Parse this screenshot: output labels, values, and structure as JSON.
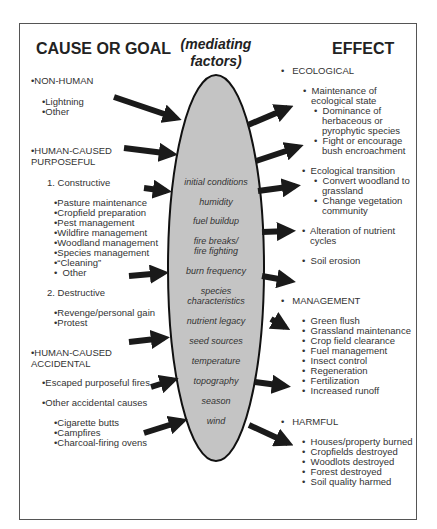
{
  "headers": {
    "cause": "CAUSE OR GOAL",
    "mediating_line1": "(mediating",
    "mediating_line2": "factors)",
    "effect": "EFFECT"
  },
  "causes": {
    "non_human": "•NON-HUMAN",
    "non_human_items": [
      "•Lightning",
      "•Other"
    ],
    "purposeful_line1": "•HUMAN-CAUSED",
    "purposeful_line2": "PURPOSEFUL",
    "constructive": "1. Constructive",
    "constructive_items": [
      "•Pasture maintenance",
      "•Cropfield preparation",
      "•Pest management",
      "•Wildfire management",
      "•Woodland management",
      "•Species management",
      "•“Cleaning”",
      "•  Other"
    ],
    "destructive": "2. Destructive",
    "destructive_items": [
      "•Revenge/personal gain",
      "•Protest"
    ],
    "accidental_line1": "•HUMAN-CAUSED",
    "accidental_line2": "ACCIDENTAL",
    "escaped": "•Escaped purposeful fires",
    "other_accidental": "•Other accidental causes",
    "other_accidental_items": [
      "•Cigarette butts",
      "•Campfires",
      "•Charcoal-firing ovens"
    ]
  },
  "factors": [
    "initial conditions",
    "humidity",
    "fuel buildup",
    "fire breaks/",
    "fire fighting",
    "burn frequency",
    "species",
    "characteristics",
    "nutrient legacy",
    "seed sources",
    "temperature",
    "topography",
    "season",
    "wind"
  ],
  "effects": {
    "ecological": "•   ECOLOGICAL",
    "eco_lines": [
      "•  Maintenance of",
      "   ecological state",
      "•  Dominance of",
      "   herbaceous or",
      "   pyrophytic species",
      "•  Fight or encourage",
      "   bush encroachment",
      "•  Ecological transition",
      "•  Convert woodland to",
      "   grassland",
      "•  Change vegetation",
      "   community",
      "•  Alteration of nutrient",
      "   cycles",
      "•  Soil erosion"
    ],
    "management": "•   MANAGEMENT",
    "management_items": [
      "•  Green flush",
      "•  Grassland maintenance",
      "•  Crop field clearance",
      "•  Fuel management",
      "•  Insect control",
      "•  Regeneration",
      "•  Fertilization",
      "•  Increased runoff"
    ],
    "harmful": "•   HARMFUL",
    "harmful_items": [
      "•  Houses/property burned",
      "•  Cropfields destroyed",
      "•  Woodlots destroyed",
      "•  Forest destroyed",
      "•  Soil quality harmed"
    ]
  },
  "colors": {
    "ellipse_fill": "#c4c4c4",
    "arrow": "#1a1a1a",
    "border": "#555555"
  }
}
